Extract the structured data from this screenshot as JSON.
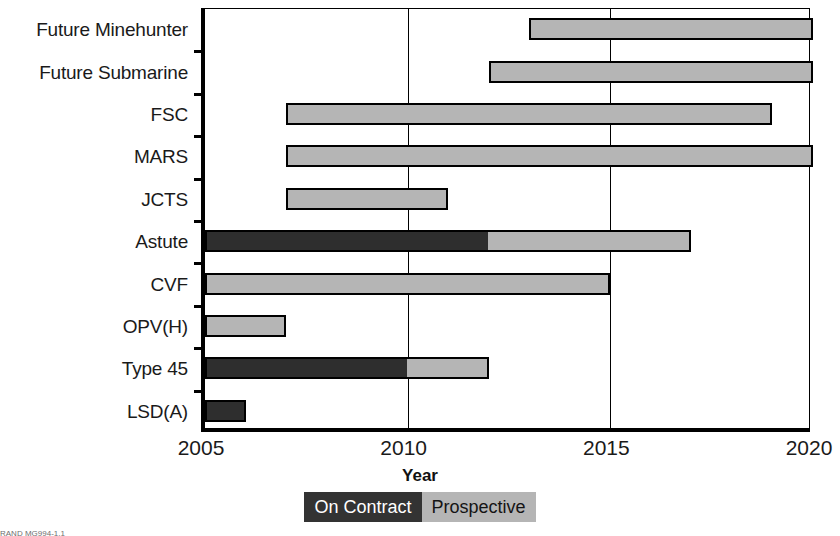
{
  "chart_data": {
    "type": "bar",
    "orientation": "horizontal",
    "subtype": "gantt-timeline",
    "title": "",
    "xlabel": "Year",
    "ylabel": "",
    "xlim": [
      2005,
      2020
    ],
    "xticks": [
      2005,
      2010,
      2015,
      2020
    ],
    "xticklabels": [
      "2005",
      "2010",
      "2015",
      "2020"
    ],
    "grid": "vertical-only",
    "categories": [
      "Future Minehunter",
      "Future Submarine",
      "FSC",
      "MARS",
      "JCTS",
      "Astute",
      "CVF",
      "OPV(H)",
      "Type 45",
      "LSD(A)"
    ],
    "legend": {
      "position": "bottom-center",
      "entries": [
        {
          "label": "On Contract",
          "color": "#333333",
          "text_color": "#ffffff"
        },
        {
          "label": "Prospective",
          "color": "#b5b5b5",
          "text_color": "#141414"
        }
      ]
    },
    "series": [
      {
        "name": "On Contract",
        "color": "#2e2e2e"
      },
      {
        "name": "Prospective",
        "color": "#b5b5b5"
      }
    ],
    "bars": [
      {
        "category": "Future Minehunter",
        "start": 2013,
        "end": 2020,
        "segments": [
          {
            "series": "Prospective",
            "start": 2013,
            "end": 2020
          }
        ]
      },
      {
        "category": "Future Submarine",
        "start": 2012,
        "end": 2020,
        "segments": [
          {
            "series": "Prospective",
            "start": 2012,
            "end": 2020
          }
        ]
      },
      {
        "category": "FSC",
        "start": 2007,
        "end": 2019,
        "segments": [
          {
            "series": "Prospective",
            "start": 2007,
            "end": 2019
          }
        ]
      },
      {
        "category": "MARS",
        "start": 2007,
        "end": 2020,
        "segments": [
          {
            "series": "Prospective",
            "start": 2007,
            "end": 2020
          }
        ]
      },
      {
        "category": "JCTS",
        "start": 2007,
        "end": 2011,
        "segments": [
          {
            "series": "Prospective",
            "start": 2007,
            "end": 2011
          }
        ]
      },
      {
        "category": "Astute",
        "start": 2005,
        "end": 2017,
        "segments": [
          {
            "series": "On Contract",
            "start": 2005,
            "end": 2012
          },
          {
            "series": "Prospective",
            "start": 2012,
            "end": 2017
          }
        ]
      },
      {
        "category": "CVF",
        "start": 2005,
        "end": 2015,
        "segments": [
          {
            "series": "Prospective",
            "start": 2005,
            "end": 2015
          }
        ]
      },
      {
        "category": "OPV(H)",
        "start": 2005,
        "end": 2007,
        "segments": [
          {
            "series": "Prospective",
            "start": 2005,
            "end": 2007
          }
        ]
      },
      {
        "category": "Type 45",
        "start": 2005,
        "end": 2012,
        "segments": [
          {
            "series": "On Contract",
            "start": 2005,
            "end": 2010
          },
          {
            "series": "Prospective",
            "start": 2010,
            "end": 2012
          }
        ]
      },
      {
        "category": "LSD(A)",
        "start": 2005,
        "end": 2006,
        "segments": [
          {
            "series": "On Contract",
            "start": 2005,
            "end": 2006
          }
        ]
      }
    ]
  },
  "footer": {
    "note": "RAND MG994-1.1"
  }
}
